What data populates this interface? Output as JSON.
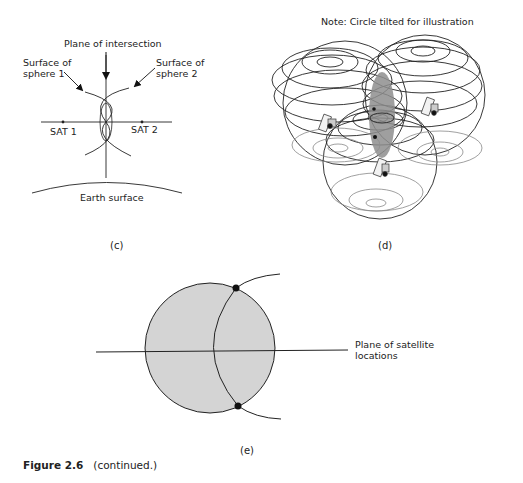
{
  "panel_c": {
    "label": "(c)",
    "plane_label": "Plane of intersection",
    "sphere1_label_line1": "Surface of",
    "sphere1_label_line2": "sphere 1",
    "sphere2_label_line1": "Surface of",
    "sphere2_label_line2": "sphere 2",
    "sat1_label": "SAT 1",
    "sat2_label": "SAT 2",
    "earth_label": "Earth surface"
  },
  "panel_d": {
    "label": "(d)",
    "note": "Note: Circle tilted for illustration"
  },
  "panel_e": {
    "label": "(e)",
    "plane_label_line1": "Plane of satellite",
    "plane_label_line2": "locations",
    "fill_color": "#d4d4d4"
  },
  "caption": {
    "figure_number": "Figure 2.6",
    "text": "(continued.)"
  }
}
